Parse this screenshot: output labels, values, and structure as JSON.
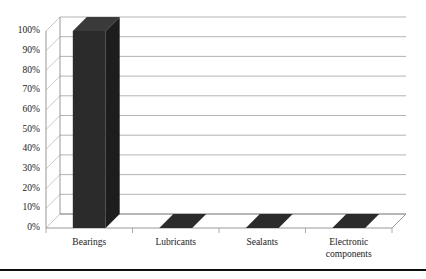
{
  "chart_data": {
    "type": "bar",
    "title": "",
    "subtitle": "",
    "xlabel": "",
    "ylabel": "",
    "categories": [
      "Bearings",
      "Lubricants",
      "Sealants",
      "Electronic components"
    ],
    "values": [
      100,
      0,
      0,
      0
    ],
    "value_unit": "%",
    "ylim": [
      0,
      100
    ],
    "y_tick_step": 10,
    "y_tick_labels": [
      "0%",
      "10%",
      "20%",
      "30%",
      "40%",
      "50%",
      "60%",
      "70%",
      "80%",
      "90%",
      "100%"
    ],
    "y_tick_values": [
      0,
      10,
      20,
      30,
      40,
      50,
      60,
      70,
      80,
      90,
      100
    ],
    "x_tick_labels": [
      [
        "Bearings"
      ],
      [
        "Lubricants"
      ],
      [
        "Sealants"
      ],
      [
        "Electronic",
        "components"
      ]
    ],
    "series": [
      {
        "name": "Share",
        "values": [
          100,
          0,
          0,
          0
        ]
      }
    ],
    "grid": true,
    "grid_axis": "y",
    "legend": false,
    "legend_position": "none",
    "perspective": "3d",
    "bar_color": "#2b2b2b",
    "grid_color": "#aaaaaa",
    "axis_color": "#8d8d8d",
    "text_color": "#1a1a1a",
    "background": "#ffffff",
    "annotations": []
  },
  "figure": {
    "rule_color": "#0d0d0d",
    "rule_label": "bottom-divider"
  }
}
